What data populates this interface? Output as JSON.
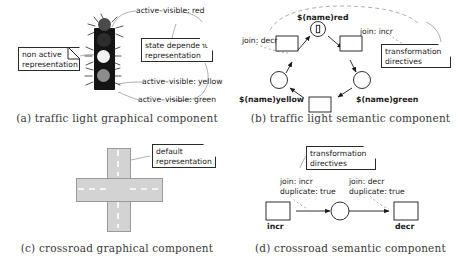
{
  "figure": {
    "panels": [
      {
        "id": "a",
        "caption": "(a) traffic light graphical component",
        "notes": [
          {
            "name": "non-active-note",
            "lines": [
              "non active",
              "representation"
            ]
          },
          {
            "name": "state-dependent-note",
            "lines": [
              "state dependent",
              "representation"
            ]
          }
        ],
        "annotations": [
          {
            "name": "active-visible-red",
            "text": "active–visible: red"
          },
          {
            "name": "active-visible-yellow",
            "text": "active–visible: yellow"
          },
          {
            "name": "active-visible-green",
            "text": "active–visible: green"
          }
        ],
        "traffic_light": {
          "body_color": "#141414",
          "lamps": [
            {
              "name": "lamp-red",
              "color": "#4a4a4a",
              "state": "active"
            },
            {
              "name": "lamp-yellow",
              "color": "#f2f2f2",
              "state": "active"
            },
            {
              "name": "lamp-green",
              "color": "#8c8c8c",
              "state": "active"
            }
          ]
        }
      },
      {
        "id": "b",
        "caption": "(b) traffic light semantic component",
        "notes": [
          {
            "name": "transformation-directives-note",
            "lines": [
              "transformation",
              "directives"
            ]
          }
        ],
        "annotations": [
          {
            "name": "join-decr-label",
            "text": "join: decr"
          },
          {
            "name": "join-incr-label",
            "text": "join: incr"
          }
        ],
        "places": [
          {
            "name": "place-red",
            "label": "$(name)red",
            "marked": true
          },
          {
            "name": "place-yellow",
            "label": "$(name)yellow",
            "marked": false
          },
          {
            "name": "place-green",
            "label": "$(name)green",
            "marked": false
          }
        ],
        "transitions": [
          {
            "name": "transition-left",
            "label": ""
          },
          {
            "name": "transition-right",
            "label": ""
          },
          {
            "name": "transition-bottom",
            "label": ""
          }
        ]
      },
      {
        "id": "c",
        "caption": "(c) crossroad graphical component",
        "notes": [
          {
            "name": "default-representation-note",
            "lines": [
              "default",
              "representation"
            ]
          }
        ],
        "crossroad": {
          "road_color": "#d3d3d3",
          "lane_marking_color": "#ffffff"
        }
      },
      {
        "id": "d",
        "caption": "(d) crossroad semantic component",
        "notes": [
          {
            "name": "transformation-directives-note",
            "lines": [
              "transformation",
              "directives"
            ]
          }
        ],
        "annotations": [
          {
            "name": "join-incr-duplicate-label",
            "lines": [
              "join: incr",
              "duplicate: true"
            ]
          },
          {
            "name": "join-decr-duplicate-label",
            "lines": [
              "join: decr",
              "duplicate: true"
            ]
          }
        ],
        "transitions": [
          {
            "name": "transition-incr",
            "label": "incr"
          },
          {
            "name": "transition-decr",
            "label": "decr"
          }
        ],
        "places": [
          {
            "name": "place-middle",
            "label": "",
            "marked": false
          }
        ]
      }
    ]
  }
}
